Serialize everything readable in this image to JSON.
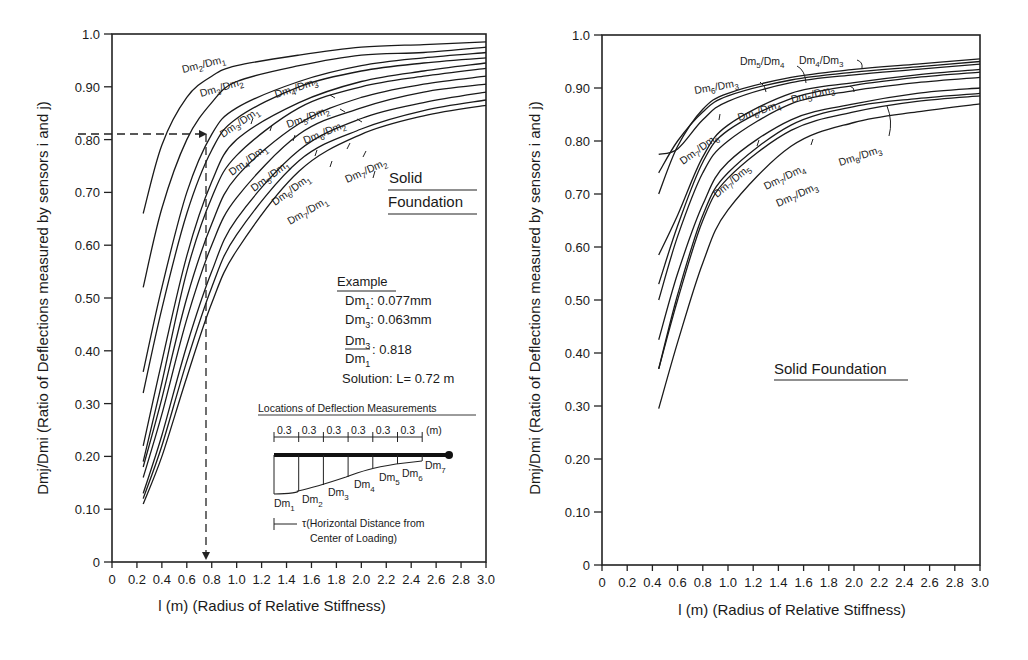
{
  "chart_data": [
    {
      "type": "line",
      "panel": "left",
      "title": "",
      "xlabel": "l (m) (Radius of Relative Stiffness)",
      "ylabel": "Dmj/Dmi (Ratio of Deflections measured by sensors i and j)",
      "xlim": [
        0,
        3.0
      ],
      "ylim": [
        0,
        1.0
      ],
      "grid": false,
      "x_ticks": [
        "0",
        "0.2",
        "0.4",
        "0.6",
        "0.8",
        "1.0",
        "1.2",
        "1.4",
        "1.6",
        "1.8",
        "2.0",
        "2.2",
        "2.4",
        "2.6",
        "2.8",
        "3.0"
      ],
      "y_ticks": [
        "0",
        "0.10",
        "0.20",
        "0.30",
        "0.40",
        "0.50",
        "0.60",
        "0.70",
        "0.80",
        "0.90",
        "1.0"
      ],
      "annotation_title": "Solid Foundation",
      "series": [
        {
          "name": "Dm2/Dm1",
          "x": [
            0.25,
            0.4,
            0.6,
            0.8,
            1.0,
            1.5,
            2.0,
            2.5,
            3.0
          ],
          "values": [
            0.66,
            0.79,
            0.88,
            0.92,
            0.94,
            0.96,
            0.975,
            0.98,
            0.985
          ]
        },
        {
          "name": "Dm3/Dm2",
          "x": [
            0.25,
            0.4,
            0.6,
            0.8,
            1.0,
            1.5,
            2.0,
            2.5,
            3.0
          ],
          "values": [
            0.52,
            0.67,
            0.8,
            0.87,
            0.91,
            0.94,
            0.96,
            0.965,
            0.975
          ]
        },
        {
          "name": "Dm3/Dm1",
          "x": [
            0.25,
            0.4,
            0.6,
            0.8,
            1.0,
            1.5,
            2.0,
            2.5,
            3.0
          ],
          "values": [
            0.36,
            0.52,
            0.7,
            0.81,
            0.86,
            0.91,
            0.94,
            0.955,
            0.965
          ]
        },
        {
          "name": "Dm4/Dm3",
          "x": [
            0.25,
            0.4,
            0.6,
            0.8,
            1.0,
            1.5,
            2.0,
            2.5,
            3.0
          ],
          "values": [
            0.32,
            0.48,
            0.66,
            0.78,
            0.84,
            0.9,
            0.93,
            0.945,
            0.955
          ]
        },
        {
          "name": "Dm4/Dm1",
          "x": [
            0.25,
            0.4,
            0.6,
            0.8,
            1.0,
            1.5,
            2.0,
            2.5,
            3.0
          ],
          "values": [
            0.22,
            0.38,
            0.58,
            0.72,
            0.8,
            0.87,
            0.91,
            0.93,
            0.945
          ]
        },
        {
          "name": "Dm5/Dm2",
          "x": [
            0.25,
            0.4,
            0.6,
            0.8,
            1.0,
            1.5,
            2.0,
            2.5,
            3.0
          ],
          "values": [
            0.19,
            0.34,
            0.55,
            0.69,
            0.77,
            0.86,
            0.9,
            0.92,
            0.935
          ]
        },
        {
          "name": "Dm5/Dm1",
          "x": [
            0.25,
            0.4,
            0.6,
            0.8,
            1.0,
            1.5,
            2.0,
            2.5,
            3.0
          ],
          "values": [
            0.18,
            0.31,
            0.5,
            0.64,
            0.73,
            0.83,
            0.88,
            0.905,
            0.92
          ]
        },
        {
          "name": "Dm6/Dm2",
          "x": [
            0.25,
            0.4,
            0.6,
            0.8,
            1.0,
            1.5,
            2.0,
            2.5,
            3.0
          ],
          "values": [
            0.16,
            0.28,
            0.46,
            0.6,
            0.69,
            0.81,
            0.86,
            0.89,
            0.905
          ]
        },
        {
          "name": "Dm6/Dm1",
          "x": [
            0.25,
            0.4,
            0.6,
            0.8,
            1.0,
            1.5,
            2.0,
            2.5,
            3.0
          ],
          "values": [
            0.13,
            0.24,
            0.41,
            0.55,
            0.65,
            0.78,
            0.84,
            0.87,
            0.89
          ]
        },
        {
          "name": "Dm7/Dm2",
          "x": [
            0.25,
            0.4,
            0.6,
            0.8,
            1.0,
            1.5,
            2.0,
            2.5,
            3.0
          ],
          "values": [
            0.12,
            0.22,
            0.38,
            0.52,
            0.62,
            0.76,
            0.82,
            0.855,
            0.875
          ]
        },
        {
          "name": "Dm7/Dm1",
          "x": [
            0.25,
            0.4,
            0.6,
            0.8,
            1.0,
            1.5,
            2.0,
            2.5,
            3.0
          ],
          "values": [
            0.11,
            0.2,
            0.35,
            0.49,
            0.59,
            0.74,
            0.81,
            0.845,
            0.865
          ]
        }
      ],
      "example": {
        "title": "Example",
        "dm1": "Dm1: 0.077mm",
        "dm3": "Dm3: 0.063mm",
        "ratio": "Dm3/Dm1: 0.818",
        "solution": "Solution: L= 0.72 m",
        "guide_y": 0.81,
        "guide_x": 0.77
      }
    },
    {
      "type": "line",
      "panel": "right",
      "title": "",
      "xlabel": "l (m) (Radius of Relative Stiffness)",
      "ylabel": "Dmj/Dmi (Ratio of Deflections measured by sensors i and j)",
      "xlim": [
        0,
        3.0
      ],
      "ylim": [
        0,
        1.0
      ],
      "grid": false,
      "x_ticks": [
        "0",
        "0.2",
        "0.4",
        "0.6",
        "0.8",
        "1.0",
        "1.2",
        "1.4",
        "1.6",
        "1.8",
        "2.0",
        "2.2",
        "2.4",
        "2.6",
        "2.8",
        "3.0"
      ],
      "y_ticks": [
        "0",
        "0.10",
        "0.20",
        "0.30",
        "0.40",
        "0.50",
        "0.60",
        "0.70",
        "0.80",
        "0.90",
        "1.0"
      ],
      "annotation_title": "Solid Foundation",
      "series": [
        {
          "name": "Dm5/Dm4",
          "x": [
            0.45,
            0.6,
            0.8,
            1.0,
            1.5,
            2.0,
            2.5,
            3.0
          ],
          "values": [
            0.7,
            0.79,
            0.86,
            0.89,
            0.92,
            0.935,
            0.945,
            0.955
          ]
        },
        {
          "name": "Dm4/Dm3",
          "x": [
            0.45,
            0.6,
            0.8,
            1.0,
            1.5,
            2.0,
            2.5,
            3.0
          ],
          "values": [
            0.74,
            0.8,
            0.855,
            0.885,
            0.915,
            0.93,
            0.94,
            0.95
          ]
        },
        {
          "name": "Dm6/Dm3",
          "x": [
            0.45,
            0.6,
            0.8,
            1.0,
            1.5,
            2.0,
            2.5,
            3.0
          ],
          "values": [
            0.775,
            0.785,
            0.84,
            0.875,
            0.91,
            0.925,
            0.935,
            0.945
          ]
        },
        {
          "name": "Dm7/Dm6",
          "x": [
            0.45,
            0.6,
            0.8,
            1.0,
            1.5,
            2.0,
            2.5,
            3.0
          ],
          "values": [
            0.585,
            0.66,
            0.77,
            0.83,
            0.89,
            0.91,
            0.925,
            0.935
          ]
        },
        {
          "name": "Dm6/Dm4",
          "x": [
            0.45,
            0.6,
            0.8,
            1.0,
            1.5,
            2.0,
            2.5,
            3.0
          ],
          "values": [
            0.53,
            0.64,
            0.76,
            0.82,
            0.88,
            0.905,
            0.92,
            0.93
          ]
        },
        {
          "name": "Dm5/Dm3",
          "x": [
            0.45,
            0.6,
            0.8,
            1.0,
            1.5,
            2.0,
            2.5,
            3.0
          ],
          "values": [
            0.5,
            0.62,
            0.74,
            0.8,
            0.87,
            0.895,
            0.91,
            0.92
          ]
        },
        {
          "name": "Dm7/Dm5",
          "x": [
            0.45,
            0.6,
            0.8,
            1.0,
            1.5,
            2.0,
            2.5,
            3.0
          ],
          "values": [
            0.425,
            0.55,
            0.68,
            0.76,
            0.84,
            0.87,
            0.89,
            0.9
          ]
        },
        {
          "name": "Dm7/Dm4",
          "x": [
            0.45,
            0.6,
            0.8,
            1.0,
            1.5,
            2.0,
            2.5,
            3.0
          ],
          "values": [
            0.37,
            0.51,
            0.66,
            0.74,
            0.83,
            0.865,
            0.88,
            0.89
          ]
        },
        {
          "name": "Dm8/Dm3",
          "x": [
            0.45,
            0.6,
            0.8,
            1.0,
            1.5,
            2.0,
            2.5,
            3.0
          ],
          "values": [
            0.37,
            0.5,
            0.65,
            0.73,
            0.82,
            0.855,
            0.875,
            0.885
          ]
        },
        {
          "name": "Dm7/Dm3",
          "x": [
            0.45,
            0.6,
            0.8,
            1.0,
            1.5,
            2.0,
            2.5,
            3.0
          ],
          "values": [
            0.295,
            0.42,
            0.57,
            0.67,
            0.79,
            0.835,
            0.855,
            0.87
          ]
        }
      ]
    }
  ],
  "left": {
    "y_axis_title": "Dmj/Dmi (Ratio of Deflections measured by sensors i and j)",
    "x_axis_title": "l (m) (Radius of Relative Stiffness)",
    "solid": "Solid",
    "foundation": "Foundation",
    "example_title": "Example",
    "dm1_label": "Dm",
    "dm1_sub": "1",
    "dm1_value": ": 0.077mm",
    "dm3_label": "Dm",
    "dm3_sub": "3",
    "dm3_value": ": 0.063mm",
    "ratio_num": "Dm",
    "ratio_num_sub": "3",
    "ratio_den": "Dm",
    "ratio_den_sub": "1",
    "ratio_value": ": 0.818",
    "solution": "Solution: L= 0.72 m",
    "inset_title": "Locations of Deflection Measurements",
    "spacing": [
      "0.3",
      "0.3",
      "0.3",
      "0.3",
      "0.3",
      "0.3"
    ],
    "spacing_unit": "(m)",
    "sensors": [
      "Dm1",
      "Dm2",
      "Dm3",
      "Dm4",
      "Dm5",
      "Dm6",
      "Dm7"
    ],
    "tau_line1": "τ(Horizontal Distance from",
    "tau_line2": "Center of Loading)"
  },
  "right": {
    "y_axis_title": "Dmj/Dmi (Ratio of Deflections measured by sensors i and j)",
    "x_axis_title": "l (m) (Radius of Relative Stiffness)",
    "solid_foundation": "Solid Foundation"
  }
}
